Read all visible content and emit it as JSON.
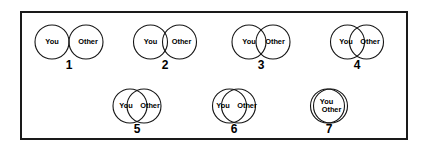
{
  "diagram": {
    "name": "inclusion-of-other-in-the-self-scale",
    "frame": {
      "border_color": "#1a1a1a",
      "background_color": "#ffffff"
    },
    "stroke_color": "#151515",
    "text_color": "#000000",
    "self_label": "You",
    "other_label": "Other",
    "items": [
      {
        "number": "1",
        "self_label": "You",
        "other_label": "Other",
        "overlap": "none",
        "center_x": 67,
        "center_y": 40,
        "radius": 17,
        "separation": 34,
        "number_x": 67,
        "number_y": 56,
        "stacked": false
      },
      {
        "number": "2",
        "self_label": "You",
        "other_label": "Other",
        "overlap": "slight",
        "center_x": 163,
        "center_y": 40,
        "radius": 17,
        "separation": 29,
        "number_x": 163,
        "number_y": 56,
        "stacked": false
      },
      {
        "number": "3",
        "self_label": "You",
        "other_label": "Other",
        "overlap": "small",
        "center_x": 259,
        "center_y": 40,
        "radius": 17,
        "separation": 24,
        "number_x": 259,
        "number_y": 56,
        "stacked": false
      },
      {
        "number": "4",
        "self_label": "You",
        "other_label": "Other",
        "overlap": "moderate",
        "center_x": 355,
        "center_y": 40,
        "radius": 17,
        "separation": 19,
        "number_x": 355,
        "number_y": 56,
        "stacked": false
      },
      {
        "number": "5",
        "self_label": "You",
        "other_label": "Other",
        "overlap": "large",
        "center_x": 135,
        "center_y": 104,
        "radius": 17,
        "separation": 14,
        "number_x": 135,
        "number_y": 120,
        "stacked": false
      },
      {
        "number": "6",
        "self_label": "You",
        "other_label": "Other",
        "overlap": "very-large",
        "center_x": 232,
        "center_y": 104,
        "radius": 17,
        "separation": 9,
        "number_x": 232,
        "number_y": 120,
        "stacked": false
      },
      {
        "number": "7",
        "self_label": "You",
        "other_label": "Other",
        "overlap": "near-complete",
        "center_x": 327,
        "center_y": 104,
        "radius": 17,
        "separation": 3,
        "number_x": 327,
        "number_y": 120,
        "stacked": true
      }
    ]
  }
}
